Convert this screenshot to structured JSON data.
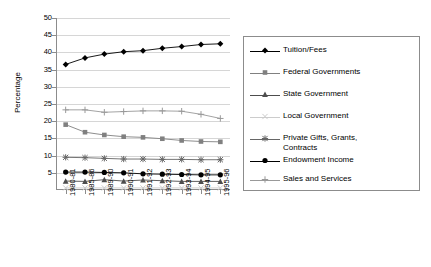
{
  "chart_data": {
    "type": "line",
    "title": "",
    "xlabel": "",
    "ylabel": "Percentage",
    "ylim": [
      0,
      50
    ],
    "ytick_step": 5,
    "grid": true,
    "legend_position": "right",
    "categories": [
      "1980-81",
      "1985-86",
      "1989-90",
      "1990-91",
      "1991-92",
      "1992-93",
      "1993-94",
      "1994-95",
      "1995-96"
    ],
    "ytick_labels": [
      "50",
      "45",
      "40",
      "35",
      "30",
      "25",
      "20",
      "15",
      "10",
      "5"
    ],
    "series": [
      {
        "name": "Tuition/Fees",
        "marker": "diamond",
        "color": "#000000",
        "values": [
          36.5,
          38.4,
          39.5,
          40.2,
          40.5,
          41.2,
          41.7,
          42.3,
          42.5
        ]
      },
      {
        "name": "Federal Governments",
        "marker": "square",
        "color": "#808080",
        "values": [
          19.0,
          16.8,
          16.0,
          15.5,
          15.3,
          14.9,
          14.4,
          14.1,
          14.0
        ]
      },
      {
        "name": "State Government",
        "marker": "triangle",
        "color": "#4d4d4d",
        "values": [
          2.6,
          2.5,
          3.0,
          2.6,
          2.9,
          2.7,
          2.5,
          2.5,
          2.5
        ]
      },
      {
        "name": "Local Government",
        "marker": "x",
        "color": "#cccccc",
        "values": [
          0.6,
          0.6,
          0.6,
          0.6,
          0.6,
          0.6,
          0.6,
          0.6,
          0.6
        ]
      },
      {
        "name": "Private Gifts, Grants,\nContracts",
        "marker": "star",
        "color": "#666666",
        "values": [
          9.5,
          9.4,
          9.2,
          9.0,
          9.0,
          8.9,
          8.9,
          8.8,
          8.8
        ]
      },
      {
        "name": "Endowment Income",
        "marker": "circle",
        "color": "#000000",
        "values": [
          5.2,
          5.2,
          5.1,
          5.0,
          4.7,
          4.6,
          4.5,
          4.4,
          4.4
        ]
      },
      {
        "name": "Sales and Services",
        "marker": "plus",
        "color": "#999999",
        "values": [
          23.3,
          23.3,
          22.6,
          22.8,
          23.0,
          23.0,
          22.9,
          22.0,
          20.8
        ]
      }
    ]
  }
}
